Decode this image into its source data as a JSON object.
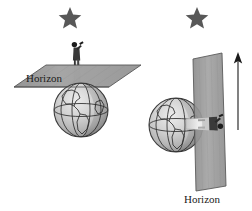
{
  "figure": {
    "type": "diagram",
    "title": "",
    "background_color": "#ffffff",
    "width": 252,
    "height": 211
  },
  "palette": {
    "plane_fill": "#9a9a9a",
    "plane_fill_light": "#a8a8a8",
    "plane_stroke": "#4a4a4a",
    "globe_light": "#dedede",
    "globe_mid": "#c2c2c2",
    "globe_dark": "#9c9c9c",
    "globe_stroke": "#3a3a3a",
    "continent_stroke": "#2e2e2e",
    "star_fill": "#585858",
    "arrow_color": "#1b1b1b",
    "person_dark": "#2b2b2b",
    "person_light": "#e8e8e8",
    "text_color": "#1b1b1b"
  },
  "panels": [
    {
      "id": "left-panel",
      "name": "observer-at-pole",
      "star": {
        "label": "star",
        "x": 70,
        "y": 16,
        "size": 11
      },
      "globe": {
        "label": "earth-globe",
        "cx": 81,
        "cy": 110,
        "r": 27
      },
      "observer": {
        "label": "observer-standing",
        "x": 72,
        "y": 46,
        "orientation": "upright"
      },
      "horizon_plane": {
        "label": "horizon-plane",
        "orientation": "horizontal"
      },
      "horizon_label": {
        "text": "Horizon",
        "x": 26,
        "y": 82
      }
    },
    {
      "id": "right-panel",
      "name": "observer-at-equator",
      "star": {
        "label": "star",
        "x": 197,
        "y": 16,
        "size": 11
      },
      "globe": {
        "label": "earth-globe",
        "cx": 176,
        "cy": 125,
        "r": 27
      },
      "observer": {
        "label": "observer-lying",
        "x": 215,
        "y": 122,
        "orientation": "sideways"
      },
      "horizon_plane": {
        "label": "horizon-plane",
        "orientation": "vertical"
      },
      "horizon_label": {
        "text": "Horizon",
        "x": 184,
        "y": 203
      },
      "arrow": {
        "label": "up-arrow",
        "x": 238,
        "y1": 55,
        "y2": 130,
        "direction": "up"
      }
    }
  ]
}
